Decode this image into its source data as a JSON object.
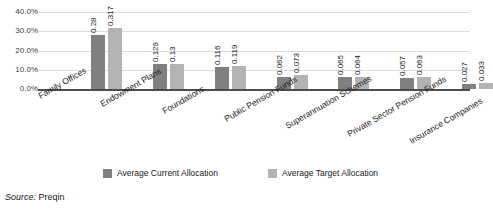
{
  "chart_data": {
    "type": "bar",
    "title": "",
    "xlabel": "",
    "ylabel": "",
    "ylim": [
      0,
      0.4
    ],
    "grid": true,
    "legend_position": "bottom",
    "ytick_labels": [
      "0.0%",
      "10.0%",
      "20.0%",
      "30.0%",
      "40.0%"
    ],
    "ytick_values": [
      0,
      0.1,
      0.2,
      0.3,
      0.4
    ],
    "categories": [
      "Family Offices",
      "Endowment Plans",
      "Foundations",
      "Public Pension Funds",
      "Superannuation Schemes",
      "Private Sector Pension Funds",
      "Insurance Companies"
    ],
    "series": [
      {
        "name": "Average Current Allocation",
        "color": "#808080",
        "values": [
          0.28,
          0.129,
          0.116,
          0.062,
          0.065,
          0.057,
          0.027
        ],
        "labels": [
          "0.28",
          "0.129",
          "0.116",
          "0.062",
          "0.065",
          "0.057",
          "0.027"
        ]
      },
      {
        "name": "Average Target Allocation",
        "color": "#b3b3b3",
        "values": [
          0.317,
          0.13,
          0.119,
          0.073,
          0.064,
          0.063,
          0.033
        ],
        "labels": [
          "0.317",
          "0.13",
          "0.119",
          "0.073",
          "0.064",
          "0.063",
          "0.033"
        ]
      }
    ]
  },
  "source": {
    "label": "Source:",
    "value": "Preqin"
  },
  "colors": {
    "series_current": "#808080",
    "series_target": "#b3b3b3",
    "gridline": "#dcdcdc",
    "axis": "#4d4d4d",
    "text": "#1a1a1a"
  }
}
